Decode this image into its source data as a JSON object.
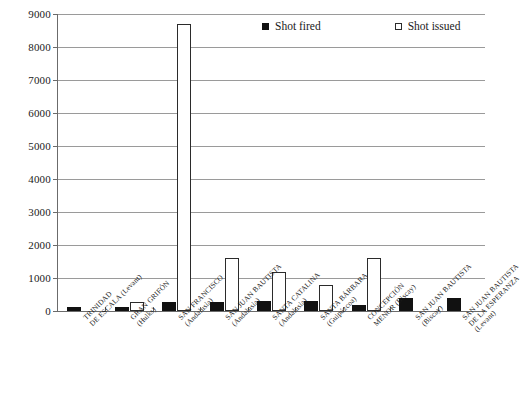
{
  "legend": {
    "position": "top-center",
    "items": [
      {
        "label": "Shot fired",
        "swatch": "filled-square",
        "color": "#111111"
      },
      {
        "label": "Shot issued",
        "swatch": "hollow-square",
        "color": "#ffffff"
      }
    ]
  },
  "axis": {
    "y_ticks": [
      "0",
      "1000",
      "2000",
      "3000",
      "4000",
      "5000",
      "6000",
      "7000",
      "8000",
      "9000"
    ]
  },
  "chart_data": {
    "type": "bar",
    "title": "",
    "xlabel": "",
    "ylabel": "",
    "ylim": [
      0,
      9000
    ],
    "ytick_step": 1000,
    "grid": "horizontal",
    "legend_position": "top-center",
    "categories": [
      "TRINIDAD DE ESCALA (Levant)",
      "GRAN GRIFÓN (Hulks)",
      "SAN FRANCISCO (Andalusia)",
      "SAN JUAN BAUTISTA (Andalusia)",
      "SANTA CATALINA (Andalusia)",
      "SANTA BÁRBARA (Guipúzcoa)",
      "CONCEPCIÓN MENOR (Biscay)",
      "SAN JUAN BAUTISTA (Biscay)",
      "SAN JUAN BAUTISTA DE LA ESPERANZA (Levant)"
    ],
    "category_lines": [
      [
        "TRINIDAD",
        "DE ESCALA (Levant)"
      ],
      [
        "GRAN GRIFÓN",
        "(Hulks)"
      ],
      [
        "SAN FRANCISCO",
        "(Andalusia)"
      ],
      [
        "SAN JUAN BAUTISTA",
        "(Andalusia)"
      ],
      [
        "SANTA CATALINA",
        "(Andalusia)"
      ],
      [
        "SANTA BÁRBARA",
        "(Guipúzcoa)"
      ],
      [
        "CONCEPCIÓN",
        "MENOR (Biscay)"
      ],
      [
        "SAN JUAN BAUTISTA",
        "(Biscay)"
      ],
      [
        "SAN JUAN BAUTISTA",
        "DE LA ESPERANZA",
        "(Levant)"
      ]
    ],
    "series": [
      {
        "name": "Shot fired",
        "values": [
          130,
          130,
          260,
          260,
          290,
          300,
          190,
          400,
          390
        ]
      },
      {
        "name": "Shot issued",
        "values": [
          0,
          260,
          8700,
          1620,
          1190,
          780,
          1620,
          0,
          0
        ]
      }
    ]
  }
}
